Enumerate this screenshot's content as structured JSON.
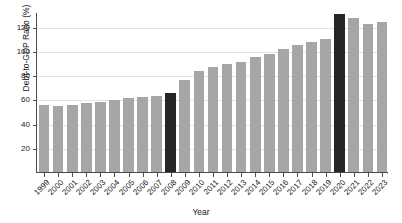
{
  "chart_data": {
    "type": "bar",
    "title": "",
    "xlabel": "Year",
    "ylabel": "Debt-to-GDP Ratio (%)",
    "categories": [
      "1999",
      "2000",
      "2001",
      "2002",
      "2003",
      "2004",
      "2005",
      "2006",
      "2007",
      "2008",
      "2009",
      "2010",
      "2011",
      "2012",
      "2013",
      "2014",
      "2015",
      "2016",
      "2017",
      "2018",
      "2019",
      "2020",
      "2021",
      "2022",
      "2023"
    ],
    "values": [
      55.5,
      54.8,
      55.2,
      56.8,
      58.0,
      59.8,
      60.8,
      61.5,
      63.0,
      65.0,
      76.0,
      83.0,
      87.0,
      89.0,
      90.5,
      94.5,
      97.5,
      101.5,
      104.5,
      107.0,
      109.5,
      130.0,
      127.0,
      122.0,
      123.5
    ],
    "highlighted": [
      "2008",
      "2020"
    ],
    "ylim": [
      0,
      132
    ],
    "yticks": [
      20,
      40,
      60,
      80,
      100,
      120
    ],
    "ytick_labels": [
      "20",
      "40",
      "60",
      "80",
      "100",
      "120"
    ],
    "grid": true,
    "legend": "none",
    "colors": {
      "bar": "#a6a6a6",
      "bar_highlight": "#262626",
      "grid": "#e2e2e2",
      "axis": "#4d4d4d",
      "text": "#1a1a1a",
      "background": "#ffffff"
    }
  }
}
